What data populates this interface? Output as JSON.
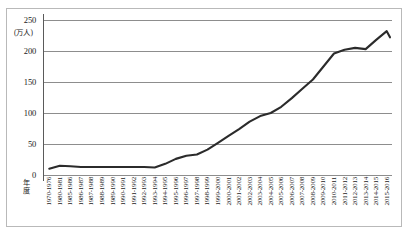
{
  "chart_data": {
    "type": "line",
    "title": "",
    "xlabel": "年度",
    "ylabel": "",
    "unit_label": "(万人)",
    "ylim": [
      0,
      250
    ],
    "yticks": [
      0,
      50,
      100,
      150,
      200,
      250
    ],
    "grid": true,
    "legend": null,
    "line_color": "#2b2b2b",
    "categories": [
      "1970-1976",
      "1980-1981",
      "1985-1986",
      "1986-1987",
      "1987-1988",
      "1988-1989",
      "1989-1990",
      "1990-1991",
      "1991-1992",
      "1992-1993",
      "1993-1994",
      "1994-1995",
      "1995-1996",
      "1996-1997",
      "1997-1998",
      "1998-1999",
      "1999-2000",
      "2000-2001",
      "2001-2002",
      "2002-2003",
      "2003-2004",
      "2004-2005",
      "2005-2006",
      "2006-2007",
      "2007-2008",
      "2008-2009",
      "2009-2010",
      "2010-2011",
      "2011-2012",
      "2012-2013",
      "2013-2014",
      "2014-2015",
      "2015-2016"
    ],
    "values": [
      10,
      15,
      14,
      13,
      13,
      13,
      13,
      13,
      13,
      13,
      12,
      18,
      26,
      31,
      33,
      41,
      52,
      63,
      74,
      86,
      95,
      100,
      110,
      124,
      139,
      154,
      175,
      196,
      202,
      205,
      203,
      218,
      232
    ],
    "final_value": 222,
    "annotations": []
  },
  "frame": {
    "border_color": "#b9b9b9"
  }
}
